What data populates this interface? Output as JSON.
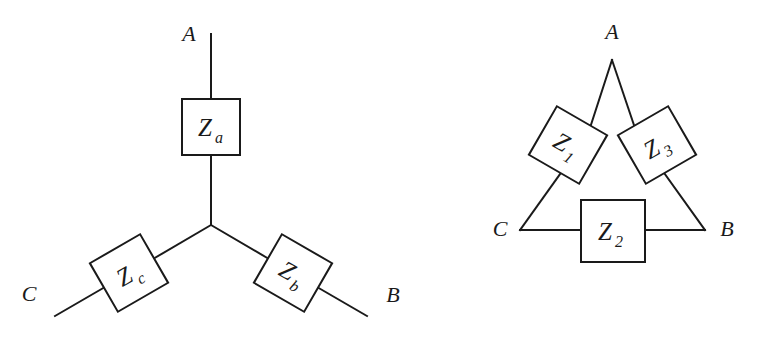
{
  "figure": {
    "background_color": "#ffffff",
    "line_color": "#1a1a1a"
  },
  "wye_network": {
    "name": "wye-network",
    "terminals": [
      {
        "id": "A",
        "label": "A"
      },
      {
        "id": "B",
        "label": "B"
      },
      {
        "id": "C",
        "label": "C"
      }
    ],
    "impedances": [
      {
        "id": "Za",
        "base": "Z",
        "subscript": "a",
        "branch": "A",
        "orientation": "upright"
      },
      {
        "id": "Zb",
        "base": "Z",
        "subscript": "b",
        "branch": "B",
        "orientation": "rotated-30"
      },
      {
        "id": "Zc",
        "base": "Z",
        "subscript": "c",
        "branch": "C",
        "orientation": "rotated-minus-30"
      }
    ]
  },
  "delta_network": {
    "name": "delta-network",
    "terminals": [
      {
        "id": "A",
        "label": "A"
      },
      {
        "id": "B",
        "label": "B"
      },
      {
        "id": "C",
        "label": "C"
      }
    ],
    "impedances": [
      {
        "id": "Z1",
        "base": "Z",
        "subscript": "1",
        "side": "C-A",
        "orientation": "rotated-30"
      },
      {
        "id": "Z2",
        "base": "Z",
        "subscript": "2",
        "side": "C-B",
        "orientation": "upright"
      },
      {
        "id": "Z3",
        "base": "Z",
        "subscript": "3",
        "side": "A-B",
        "orientation": "rotated-minus-30"
      }
    ]
  }
}
